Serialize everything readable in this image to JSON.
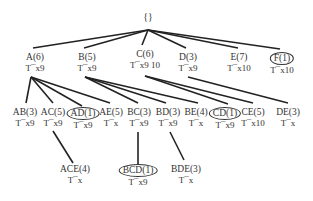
{
  "root": {
    "label": "{}"
  },
  "level1": [
    {
      "id": "A",
      "label": "A(6)",
      "sub": "T¯x9",
      "circled": false
    },
    {
      "id": "B",
      "label": "B(5)",
      "sub": "T¯x9",
      "circled": false
    },
    {
      "id": "C",
      "label": "C(6)",
      "sub": "T¯x9 10",
      "circled": false
    },
    {
      "id": "D",
      "label": "D(3)",
      "sub": "T¯x9",
      "circled": false
    },
    {
      "id": "E",
      "label": "E(7)",
      "sub": "T¯x10",
      "circled": false
    },
    {
      "id": "F",
      "label": "F(1)",
      "sub": "T¯x10",
      "circled": true
    }
  ],
  "level2": [
    {
      "id": "AB",
      "label": "AB(3)",
      "sub": "T¯x9",
      "circled": false
    },
    {
      "id": "AC",
      "label": "AC(5)",
      "sub": "T¯x9",
      "circled": false
    },
    {
      "id": "AD",
      "label": "AD(1)",
      "sub": "T¯x9",
      "circled": true
    },
    {
      "id": "AE",
      "label": "AE(5)",
      "sub": "T¯x",
      "circled": false
    },
    {
      "id": "BC",
      "label": "BC(3)",
      "sub": "T¯x9",
      "circled": false
    },
    {
      "id": "BD",
      "label": "BD(3)",
      "sub": "T¯x9",
      "circled": false
    },
    {
      "id": "BE",
      "label": "BE(4)",
      "sub": "T¯x",
      "circled": false
    },
    {
      "id": "CD",
      "label": "CD(1)",
      "sub": "T¯x9",
      "circled": true
    },
    {
      "id": "CE",
      "label": "CE(5)",
      "sub": "T¯x10",
      "circled": false
    },
    {
      "id": "DE",
      "label": "DE(3)",
      "sub": "T¯x",
      "circled": false
    }
  ],
  "level3": [
    {
      "id": "ACE",
      "label": "ACE(4)",
      "sub": "T¯x",
      "circled": false
    },
    {
      "id": "BCD",
      "label": "BCD(1)",
      "sub": "T¯x9",
      "circled": true
    },
    {
      "id": "BDE",
      "label": "BDE(3)",
      "sub": "T¯x",
      "circled": false
    }
  ],
  "edges": [
    [
      "root",
      "A"
    ],
    [
      "root",
      "B"
    ],
    [
      "root",
      "C"
    ],
    [
      "root",
      "D"
    ],
    [
      "root",
      "E"
    ],
    [
      "root",
      "F"
    ],
    [
      "A",
      "AB"
    ],
    [
      "A",
      "AC"
    ],
    [
      "A",
      "AD"
    ],
    [
      "A",
      "AE"
    ],
    [
      "B",
      "BC"
    ],
    [
      "B",
      "BD"
    ],
    [
      "B",
      "BE"
    ],
    [
      "C",
      "CD"
    ],
    [
      "C",
      "CE"
    ],
    [
      "D",
      "DE"
    ],
    [
      "AC",
      "ACE"
    ],
    [
      "BC",
      "BCD"
    ],
    [
      "BD",
      "BDE"
    ]
  ]
}
